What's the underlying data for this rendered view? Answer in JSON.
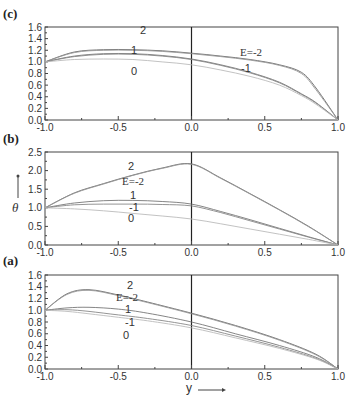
{
  "figure": {
    "x_axis_title": "y",
    "y_axis_title": "θ",
    "x_ticks": [
      "-1.0",
      "-0.5",
      "0.0",
      "0.5",
      "1.0"
    ]
  },
  "panels": [
    {
      "id": "c",
      "label": "(c)",
      "y_ticks": [
        "0.0",
        "0.2",
        "0.4",
        "0.6",
        "0.8",
        "1.0",
        "1.2",
        "1.4",
        "1.6"
      ],
      "curve_labels": {
        "e2": "2",
        "e1": "1",
        "e0": "0",
        "em2": "E=-2",
        "em1": "-1"
      }
    },
    {
      "id": "b",
      "label": "(b)",
      "y_ticks": [
        "0.0",
        "0.5",
        "1.0",
        "1.5",
        "2.0",
        "2.5"
      ],
      "curve_labels": {
        "e2": "2",
        "e1": "1",
        "e0": "0",
        "em2": "E=-2",
        "em1": "-1"
      }
    },
    {
      "id": "a",
      "label": "(a)",
      "y_ticks": [
        "0.0",
        "0.2",
        "0.4",
        "0.6",
        "0.8",
        "1.0",
        "1.2",
        "1.4",
        "1.6"
      ],
      "curve_labels": {
        "e2": "2",
        "e1": "1",
        "e0": "0",
        "em2": "E=-2",
        "em1": "-1"
      }
    }
  ],
  "chart_data": [
    {
      "type": "line",
      "title": "(c)",
      "xlabel": "y",
      "ylabel": "θ",
      "xlim": [
        -1.0,
        1.0
      ],
      "ylim": [
        0.0,
        1.6
      ],
      "x": [
        -1.0,
        -0.8,
        -0.6,
        -0.4,
        -0.2,
        0.0,
        0.2,
        0.4,
        0.6,
        0.75,
        0.85,
        1.0
      ],
      "series": [
        {
          "name": "E=2",
          "values": [
            1.0,
            1.17,
            1.21,
            1.21,
            1.19,
            1.15,
            1.1,
            1.04,
            0.95,
            0.82,
            0.55,
            0.0
          ]
        },
        {
          "name": "E=-2",
          "values": [
            1.0,
            1.16,
            1.2,
            1.2,
            1.18,
            1.14,
            1.09,
            1.03,
            0.94,
            0.8,
            0.52,
            0.0
          ]
        },
        {
          "name": "E=1",
          "values": [
            1.0,
            1.1,
            1.14,
            1.14,
            1.11,
            1.05,
            0.95,
            0.82,
            0.65,
            0.45,
            0.3,
            0.0
          ]
        },
        {
          "name": "E=-1",
          "values": [
            1.0,
            1.09,
            1.13,
            1.13,
            1.1,
            1.04,
            0.94,
            0.81,
            0.64,
            0.44,
            0.29,
            0.0
          ]
        },
        {
          "name": "E=0",
          "values": [
            1.0,
            1.04,
            1.05,
            1.04,
            1.0,
            0.95,
            0.86,
            0.75,
            0.6,
            0.42,
            0.27,
            0.0
          ]
        }
      ],
      "annotations": [
        "2",
        "1",
        "0",
        "E=-2",
        "-1"
      ]
    },
    {
      "type": "line",
      "title": "(b)",
      "xlabel": "y",
      "ylabel": "θ",
      "xlim": [
        -1.0,
        1.0
      ],
      "ylim": [
        0.0,
        2.5
      ],
      "x": [
        -1.0,
        -0.8,
        -0.6,
        -0.4,
        -0.2,
        0.0,
        0.2,
        0.4,
        0.6,
        0.8,
        1.0
      ],
      "series": [
        {
          "name": "E=2",
          "values": [
            1.0,
            1.4,
            1.65,
            1.88,
            2.07,
            2.18,
            1.8,
            1.38,
            0.95,
            0.5,
            0.0
          ]
        },
        {
          "name": "E=-2",
          "values": [
            1.0,
            1.39,
            1.64,
            1.87,
            2.06,
            2.17,
            1.79,
            1.37,
            0.94,
            0.49,
            0.0
          ]
        },
        {
          "name": "E=1",
          "values": [
            1.0,
            1.13,
            1.19,
            1.2,
            1.17,
            1.1,
            0.9,
            0.68,
            0.45,
            0.22,
            0.0
          ]
        },
        {
          "name": "E=-1",
          "values": [
            1.0,
            1.08,
            1.1,
            1.1,
            1.09,
            1.05,
            0.87,
            0.65,
            0.43,
            0.21,
            0.0
          ]
        },
        {
          "name": "E=0",
          "values": [
            1.0,
            0.97,
            0.92,
            0.85,
            0.78,
            0.7,
            0.57,
            0.43,
            0.29,
            0.15,
            0.0
          ]
        }
      ],
      "annotations": [
        "2",
        "E=-2",
        "1",
        "-1",
        "0"
      ]
    },
    {
      "type": "line",
      "title": "(a)",
      "xlabel": "y",
      "ylabel": "θ",
      "xlim": [
        -1.0,
        1.0
      ],
      "ylim": [
        0.0,
        1.6
      ],
      "x": [
        -1.0,
        -0.85,
        -0.7,
        -0.5,
        -0.3,
        0.0,
        0.3,
        0.6,
        0.85,
        1.0
      ],
      "series": [
        {
          "name": "E=2",
          "values": [
            1.0,
            1.28,
            1.35,
            1.26,
            1.14,
            0.95,
            0.74,
            0.5,
            0.25,
            0.0
          ]
        },
        {
          "name": "E=-2",
          "values": [
            1.0,
            1.27,
            1.34,
            1.25,
            1.13,
            0.94,
            0.73,
            0.49,
            0.24,
            0.0
          ]
        },
        {
          "name": "E=1",
          "values": [
            1.0,
            1.04,
            1.05,
            1.02,
            0.95,
            0.8,
            0.6,
            0.4,
            0.2,
            0.0
          ]
        },
        {
          "name": "E=-1",
          "values": [
            1.0,
            1.01,
            0.98,
            0.92,
            0.86,
            0.74,
            0.56,
            0.37,
            0.18,
            0.0
          ]
        },
        {
          "name": "E=0",
          "values": [
            1.0,
            0.98,
            0.94,
            0.88,
            0.82,
            0.7,
            0.53,
            0.35,
            0.17,
            0.0
          ]
        }
      ],
      "annotations": [
        "2",
        "E=-2",
        "1",
        "-1",
        "0"
      ]
    }
  ]
}
